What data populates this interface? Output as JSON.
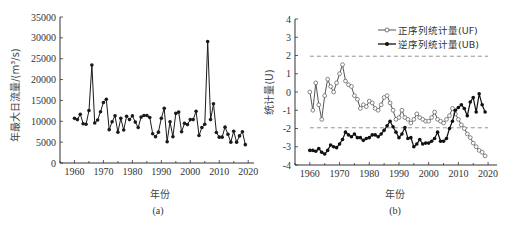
{
  "chart_data": [
    {
      "panel": "a",
      "type": "line",
      "caption": "(a)",
      "title": "",
      "xlabel": "年份",
      "ylabel": "年最大日流量/(m³/s)",
      "xlim": [
        1955,
        2022
      ],
      "ylim": [
        0,
        35000
      ],
      "xticks": [
        1960,
        1970,
        1980,
        1990,
        2000,
        2010,
        2020
      ],
      "yticks": [
        0,
        5000,
        10000,
        15000,
        20000,
        25000,
        30000,
        35000
      ],
      "grid": false,
      "marker": "filled-circle",
      "color": "#1a1a1a",
      "x": [
        1960,
        1961,
        1962,
        1963,
        1964,
        1965,
        1966,
        1967,
        1968,
        1969,
        1970,
        1971,
        1972,
        1973,
        1974,
        1975,
        1976,
        1977,
        1978,
        1979,
        1980,
        1981,
        1982,
        1983,
        1984,
        1985,
        1986,
        1987,
        1988,
        1989,
        1990,
        1991,
        1992,
        1993,
        1994,
        1995,
        1996,
        1997,
        1998,
        1999,
        2000,
        2001,
        2002,
        2003,
        2004,
        2005,
        2006,
        2007,
        2008,
        2009,
        2010,
        2011,
        2012,
        2013,
        2014,
        2015,
        2016,
        2017,
        2018,
        2019
      ],
      "values": [
        10700,
        10400,
        11700,
        9400,
        9300,
        12600,
        23500,
        9600,
        10300,
        12300,
        14500,
        15300,
        8000,
        9900,
        11300,
        7400,
        10700,
        7900,
        11200,
        10400,
        11300,
        9800,
        8500,
        11000,
        11400,
        11400,
        10900,
        7000,
        6300,
        7400,
        10700,
        13100,
        5100,
        9900,
        6300,
        11900,
        12200,
        7500,
        9500,
        9200,
        10400,
        10400,
        12400,
        6600,
        8500,
        9300,
        29100,
        10400,
        14200,
        7300,
        6200,
        6200,
        8600,
        6900,
        5000,
        7600,
        5000,
        6500,
        7500,
        4400
      ]
    },
    {
      "panel": "b",
      "type": "line",
      "caption": "(b)",
      "title": "",
      "xlabel": "年份",
      "ylabel": "统计量(U)",
      "xlim": [
        1955,
        2023
      ],
      "ylim": [
        -4,
        4
      ],
      "xticks": [
        1960,
        1970,
        1980,
        1990,
        2000,
        2010,
        2020
      ],
      "yticks": [
        -4,
        -3,
        -2,
        -1,
        0,
        1,
        2,
        3,
        4
      ],
      "grid": false,
      "legend_position": "upper right",
      "reference_lines": [
        {
          "y": 1.96,
          "style": "dashed",
          "color": "#888888"
        },
        {
          "y": -1.96,
          "style": "dashed",
          "color": "#888888"
        }
      ],
      "x": [
        1960,
        1961,
        1962,
        1963,
        1964,
        1965,
        1966,
        1967,
        1968,
        1969,
        1970,
        1971,
        1972,
        1973,
        1974,
        1975,
        1976,
        1977,
        1978,
        1979,
        1980,
        1981,
        1982,
        1983,
        1984,
        1985,
        1986,
        1987,
        1988,
        1989,
        1990,
        1991,
        1992,
        1993,
        1994,
        1995,
        1996,
        1997,
        1998,
        1999,
        2000,
        2001,
        2002,
        2003,
        2004,
        2005,
        2006,
        2007,
        2008,
        2009,
        2010,
        2011,
        2012,
        2013,
        2014,
        2015,
        2016,
        2017,
        2018,
        2019
      ],
      "series": [
        {
          "name": "正序列统计量(UF)",
          "marker": "open-circle",
          "color": "#555555",
          "values": [
            0.0,
            -1.0,
            0.5,
            -0.7,
            -1.5,
            -0.2,
            0.7,
            0.3,
            0.0,
            0.5,
            1.0,
            1.5,
            0.6,
            0.4,
            0.3,
            -0.2,
            -0.4,
            -0.9,
            -0.7,
            -0.8,
            -0.5,
            -0.6,
            -0.9,
            -1.0,
            -0.7,
            -0.3,
            -0.2,
            -0.6,
            -1.0,
            -1.5,
            -1.4,
            -1.0,
            -1.4,
            -1.5,
            -1.7,
            -1.5,
            -1.2,
            -1.4,
            -1.5,
            -1.6,
            -1.6,
            -1.4,
            -1.1,
            -1.5,
            -1.6,
            -1.7,
            -1.5,
            -1.3,
            -0.9,
            -1.2,
            -1.5,
            -1.8,
            -2.0,
            -2.3,
            -2.5,
            -2.8,
            -3.0,
            -3.2,
            -3.3,
            -3.5
          ]
        },
        {
          "name": "逆序列统计量(UB)",
          "marker": "filled-circle",
          "color": "#111111",
          "values": [
            -3.2,
            -3.2,
            -3.25,
            -3.1,
            -3.3,
            -3.4,
            -3.2,
            -2.9,
            -3.0,
            -3.05,
            -2.85,
            -2.6,
            -2.2,
            -2.35,
            -2.45,
            -2.3,
            -2.5,
            -2.5,
            -2.65,
            -2.55,
            -2.5,
            -2.35,
            -2.35,
            -2.45,
            -2.3,
            -2.1,
            -1.85,
            -1.6,
            -1.9,
            -2.2,
            -2.5,
            -2.3,
            -1.95,
            -2.55,
            -2.5,
            -3.0,
            -2.85,
            -2.6,
            -2.85,
            -2.8,
            -2.8,
            -2.7,
            -2.55,
            -2.2,
            -2.7,
            -2.7,
            -2.55,
            -2.0,
            -1.6,
            -1.0,
            -0.85,
            -0.7,
            -0.9,
            -1.3,
            -0.55,
            -0.3,
            -1.1,
            -0.1,
            -0.7,
            -1.1,
            -0.1
          ]
        }
      ]
    }
  ]
}
